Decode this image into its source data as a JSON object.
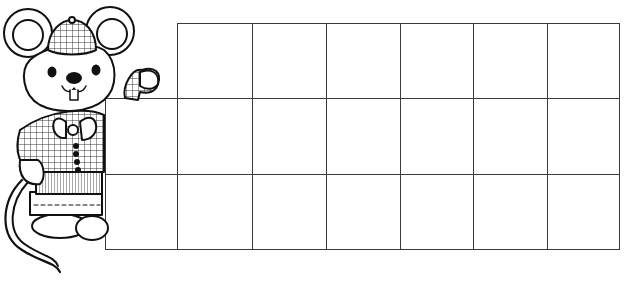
{
  "page": {
    "background": "#ffffff",
    "line_color": "#3a3a3a"
  },
  "illustration": {
    "subject": "cartoon mouse in plaid cap, bow tie and plaid jacket",
    "icon": "mouse-character-icon"
  },
  "grid": {
    "rows": [
      {
        "top": 23,
        "height": 75,
        "cols": [
          177,
          252,
          326,
          400,
          473,
          547
        ],
        "right": 619
      },
      {
        "top": 98,
        "height": 76,
        "cols": [
          105,
          177,
          252,
          326,
          400,
          473,
          547
        ],
        "right": 619
      },
      {
        "top": 174,
        "height": 75,
        "cols": [
          105,
          177,
          252,
          326,
          400,
          473,
          547
        ],
        "right": 619
      }
    ]
  }
}
